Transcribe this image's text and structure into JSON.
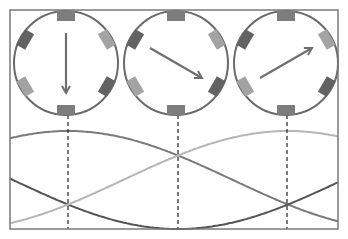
{
  "diagram": {
    "frame": {
      "x": 10,
      "y": 10,
      "width": 328,
      "height": 219,
      "stroke": "#7a7a7a"
    },
    "rotors": [
      {
        "id": "rotor-1",
        "cx": 66,
        "cy": 63,
        "r": 52,
        "arrow_angle_deg": 270,
        "label": "field-down"
      },
      {
        "id": "rotor-2",
        "cx": 176,
        "cy": 63,
        "r": 52,
        "arrow_angle_deg": 330,
        "label": "field-down-right"
      },
      {
        "id": "rotor-3",
        "cx": 286,
        "cy": 63,
        "r": 52,
        "arrow_angle_deg": 30,
        "label": "field-up-right"
      }
    ],
    "circle_stroke": "#6a6a6a",
    "arrow_color": "#6f6f6f",
    "magnets": [
      {
        "angle_deg": 90,
        "color": "#7d7d7d"
      },
      {
        "angle_deg": 150,
        "color": "#626262"
      },
      {
        "angle_deg": 30,
        "color": "#a3a3a3"
      },
      {
        "angle_deg": 270,
        "color": "#7d7d7d"
      },
      {
        "angle_deg": 210,
        "color": "#a3a3a3"
      },
      {
        "angle_deg": 330,
        "color": "#626262"
      }
    ],
    "dashed_lines_x": [
      68,
      178,
      287
    ],
    "dashed_color": "#222222"
  },
  "chart_data": {
    "type": "line",
    "title": "",
    "xlabel": "",
    "ylabel": "",
    "grid": false,
    "x_degrees_at_markers": [
      0,
      60,
      120
    ],
    "px_per_degree": 1.833,
    "x_origin_px": 68,
    "y_center_px": 180,
    "amplitude_px": 49,
    "x_range_px": [
      10,
      338
    ],
    "series": [
      {
        "name": "phase-A",
        "color": "#7a7a7a",
        "phase_deg": 0,
        "values_at_markers": [
          1.0,
          0.5,
          -0.5
        ]
      },
      {
        "name": "phase-B",
        "color": "#555555",
        "phase_deg": 120,
        "values_at_markers": [
          -0.5,
          -1.0,
          -0.5
        ]
      },
      {
        "name": "phase-C",
        "color": "#b5b5b5",
        "phase_deg": -120,
        "values_at_markers": [
          -0.5,
          0.5,
          1.0
        ]
      }
    ]
  }
}
